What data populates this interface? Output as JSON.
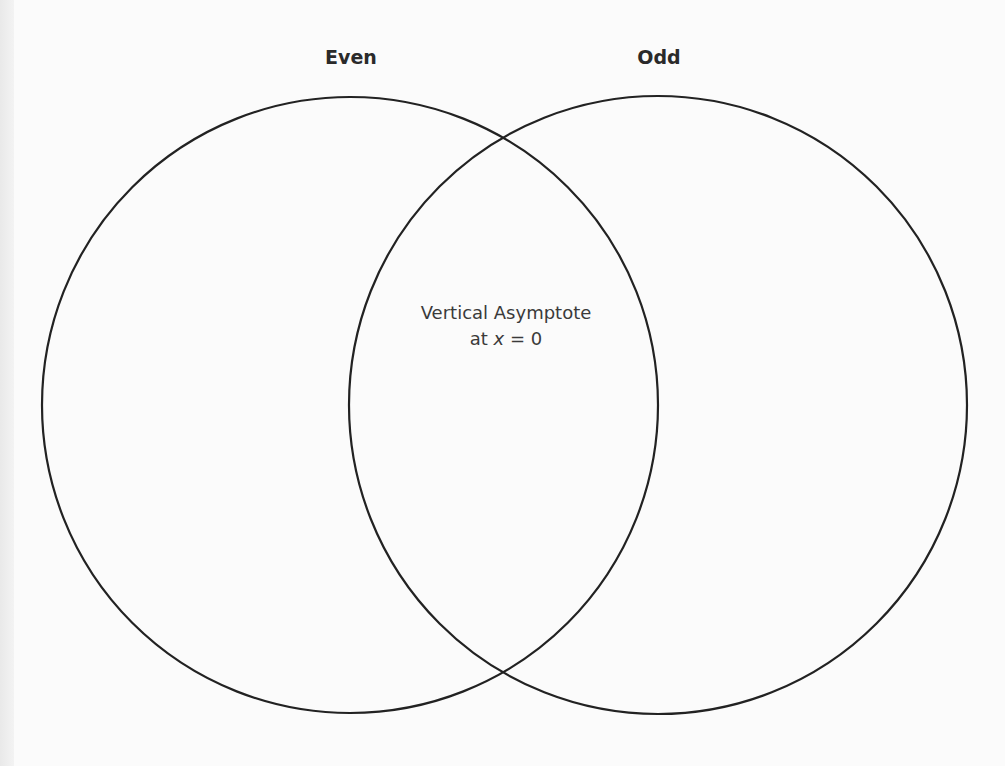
{
  "diagram": {
    "type": "venn",
    "colors": {
      "stroke": "#222222",
      "background": "#fbfbfb",
      "label_text": "#2a2a2a"
    },
    "sets": [
      {
        "label": "Even",
        "cx": 350,
        "cy": 405,
        "r": 308
      },
      {
        "label": "Odd",
        "cx": 658,
        "cy": 405,
        "r": 309
      }
    ],
    "regions": {
      "even_only": "",
      "intersection": {
        "line1": "Vertical Asymptote",
        "line2_prefix": "at ",
        "line2_var": "x",
        "line2_suffix": " = 0"
      },
      "odd_only": ""
    }
  }
}
